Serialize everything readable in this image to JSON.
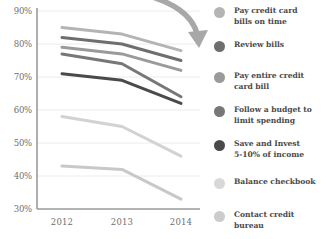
{
  "chart_data": {
    "type": "line",
    "title": "",
    "subtitle": "",
    "xlabel": "",
    "ylabel": "",
    "x": [
      "2012",
      "2013",
      "2014"
    ],
    "categories": [
      "2012",
      "2013",
      "2014"
    ],
    "ylim": [
      30,
      90
    ],
    "yticks": [
      30,
      40,
      50,
      60,
      70,
      80,
      90
    ],
    "ytick_labels": [
      "30%",
      "40%",
      "50%",
      "60%",
      "70%",
      "80%",
      "90%"
    ],
    "grid": true,
    "legend_position": "right",
    "annotations": [
      {
        "name": "downward-trend-arrow",
        "type": "curved-arrow",
        "color": "#9d9d9d"
      }
    ],
    "series": [
      {
        "name": "Pay credit card bills on time",
        "values": [
          85,
          83,
          78
        ],
        "color": "#b4b4b4"
      },
      {
        "name": "Review bills",
        "values": [
          82,
          80,
          75
        ],
        "color": "#6e6e6e"
      },
      {
        "name": "Pay entire credit card bill",
        "values": [
          79,
          77,
          72
        ],
        "color": "#9a9a9a"
      },
      {
        "name": "Follow a budget to limit spending",
        "values": [
          77,
          74,
          64
        ],
        "color": "#777777"
      },
      {
        "name": "Save and Invest 5-10% of income",
        "values": [
          71,
          69,
          62
        ],
        "color": "#4a4a4a"
      },
      {
        "name": "Balance checkbook",
        "values": [
          58,
          55,
          46
        ],
        "color": "#d2d2d2"
      },
      {
        "name": "Contact credit bureau",
        "values": [
          43,
          42,
          33
        ],
        "color": "#c8c8c8"
      }
    ]
  },
  "legend": {
    "items": [
      {
        "label": "Pay credit card\nbills on time",
        "color": "#b4b4b4"
      },
      {
        "label": "Review bills",
        "color": "#6e6e6e"
      },
      {
        "label": "Pay entire credit\ncard bill",
        "color": "#9a9a9a"
      },
      {
        "label": "Follow a budget to\nlimit spending",
        "color": "#777777"
      },
      {
        "label": "Save and Invest\n5-10% of income",
        "color": "#4a4a4a"
      },
      {
        "label": "Balance checkbook",
        "color": "#d8d8d8"
      },
      {
        "label": "Contact credit\nbureau",
        "color": "#cccccc"
      }
    ]
  },
  "axes": {
    "axis_color": "#9a9a9a",
    "grid_color": "#ececec",
    "tick_color": "#6f6f6f"
  }
}
